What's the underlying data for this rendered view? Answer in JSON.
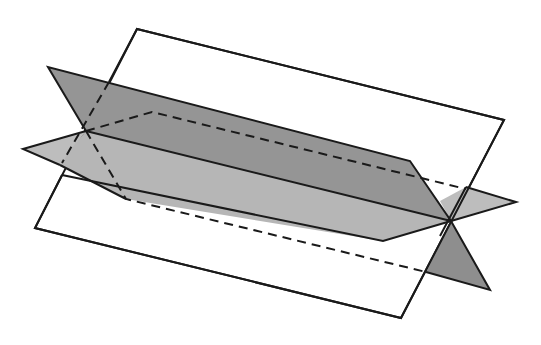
{
  "colors": {
    "background": "#ffffff",
    "light_plane": "#ececec",
    "medium_plane": "#b9b9b9",
    "dark_plane": "#8e8e8e",
    "dark_plane_over": "#9a9a9a",
    "edge": "#1a1a1a"
  },
  "geometry": {
    "intersection_points": [
      [
        86,
        131
      ],
      [
        451,
        221
      ]
    ],
    "light_plane": [
      [
        137,
        29
      ],
      [
        504,
        120
      ],
      [
        401,
        318
      ],
      [
        35,
        228
      ]
    ],
    "dark_plane_top": [
      [
        48,
        67
      ],
      [
        410,
        161
      ],
      [
        451,
        221
      ],
      [
        86,
        131
      ]
    ],
    "dark_plane_bottom": [
      [
        451,
        221
      ],
      [
        490,
        290
      ],
      [
        426,
        272
      ]
    ],
    "medium_plane_left": [
      [
        23,
        149
      ],
      [
        86,
        131
      ],
      [
        62,
        163
      ]
    ],
    "medium_plane_front": [
      [
        86,
        131
      ],
      [
        451,
        221
      ],
      [
        383,
        241
      ],
      [
        126,
        199
      ]
    ],
    "medium_plane_right": [
      [
        451,
        221
      ],
      [
        516,
        202
      ],
      [
        470,
        189
      ]
    ]
  }
}
